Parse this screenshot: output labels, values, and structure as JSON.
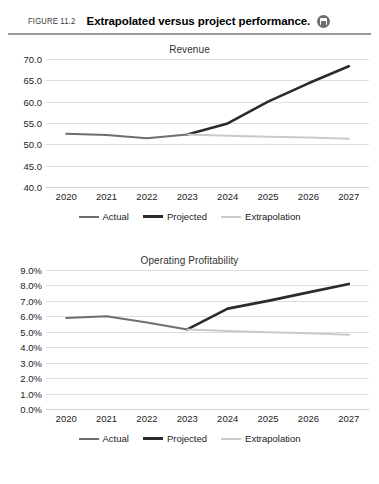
{
  "figure": {
    "label": "FIGURE 11.2",
    "title": "Extrapolated versus project performance.",
    "icon": "save-disk-icon"
  },
  "colors": {
    "actual": "#6e6e6e",
    "projected": "#2b2b2b",
    "extrapolation": "#c9c9c9",
    "gridline": "#dedede",
    "text": "#222222"
  },
  "legend": {
    "actual": "Actual",
    "projected": "Projected",
    "extrapolation": "Extrapolation"
  },
  "chart_data": [
    {
      "type": "line",
      "title": "Revenue",
      "xlabel": "",
      "ylabel": "",
      "x": [
        "2020",
        "2021",
        "2022",
        "2023",
        "2024",
        "2025",
        "2026",
        "2027"
      ],
      "yticks": [
        "40.0",
        "45.0",
        "50.0",
        "55.0",
        "60.0",
        "65.0",
        "70.0"
      ],
      "ylim": [
        40.0,
        70.0
      ],
      "grid": true,
      "legend_position": "bottom",
      "series": [
        {
          "name": "Actual",
          "color": "#6e6e6e",
          "width": 2.0,
          "x": [
            "2020",
            "2021",
            "2022",
            "2023"
          ],
          "values": [
            52.5,
            52.2,
            51.4,
            52.3
          ]
        },
        {
          "name": "Projected",
          "color": "#2b2b2b",
          "width": 2.6,
          "x": [
            "2023",
            "2024",
            "2025",
            "2026",
            "2027"
          ],
          "values": [
            52.3,
            54.9,
            60.0,
            64.3,
            68.3
          ]
        },
        {
          "name": "Extrapolation",
          "color": "#c9c9c9",
          "width": 2.0,
          "x": [
            "2023",
            "2024",
            "2025",
            "2026",
            "2027"
          ],
          "values": [
            52.3,
            52.0,
            51.8,
            51.6,
            51.3
          ]
        }
      ]
    },
    {
      "type": "line",
      "title": "Operating Profitability",
      "xlabel": "",
      "ylabel": "",
      "x": [
        "2020",
        "2021",
        "2022",
        "2023",
        "2024",
        "2025",
        "2026",
        "2027"
      ],
      "yticks": [
        "0.0%",
        "1.0%",
        "2.0%",
        "3.0%",
        "4.0%",
        "5.0%",
        "6.0%",
        "7.0%",
        "8.0%",
        "9.0%"
      ],
      "ylim": [
        0.0,
        9.0
      ],
      "grid": true,
      "legend_position": "bottom",
      "series": [
        {
          "name": "Actual",
          "color": "#6e6e6e",
          "width": 2.0,
          "x": [
            "2020",
            "2021",
            "2022",
            "2023"
          ],
          "values": [
            5.9,
            6.0,
            5.6,
            5.15
          ]
        },
        {
          "name": "Projected",
          "color": "#2b2b2b",
          "width": 2.6,
          "x": [
            "2023",
            "2024",
            "2025",
            "2026",
            "2027"
          ],
          "values": [
            5.15,
            6.5,
            7.0,
            7.55,
            8.1
          ]
        },
        {
          "name": "Extrapolation",
          "color": "#c9c9c9",
          "width": 2.0,
          "x": [
            "2023",
            "2024",
            "2025",
            "2026",
            "2027"
          ],
          "values": [
            5.15,
            5.05,
            4.97,
            4.9,
            4.8
          ]
        }
      ]
    }
  ]
}
